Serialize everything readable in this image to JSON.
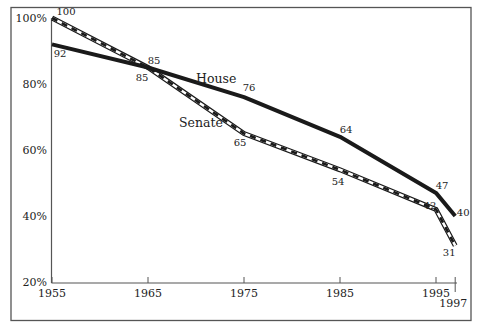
{
  "chart_data": {
    "type": "line",
    "title": "",
    "xlabel": "",
    "ylabel": "",
    "x": [
      1955,
      1965,
      1975,
      1985,
      1995,
      1997
    ],
    "x_tick_labels": [
      "1955",
      "1965",
      "1975",
      "1985",
      "1995",
      "1997"
    ],
    "y_tick_labels": [
      "100%",
      "80%",
      "60%",
      "40%",
      "20%"
    ],
    "y_ticks": [
      100,
      80,
      60,
      40,
      20
    ],
    "ylim": [
      20,
      100
    ],
    "xlim": [
      1955,
      1997
    ],
    "grid": false,
    "legend": "inline labels",
    "series": [
      {
        "name": "House",
        "style": "solid-thick",
        "values": [
          92,
          85,
          76,
          64,
          47,
          40
        ],
        "labels": [
          "92",
          "85",
          "76",
          "64",
          "47",
          "40"
        ]
      },
      {
        "name": "Senate",
        "style": "double-line-dashed",
        "values": [
          100,
          85,
          65,
          54,
          42,
          31
        ],
        "labels": [
          "100",
          "85",
          "65",
          "54",
          "42",
          "31"
        ]
      }
    ]
  },
  "colors": {
    "line": "#1a1a1a",
    "frame": "#555555",
    "background": "#ffffff"
  }
}
